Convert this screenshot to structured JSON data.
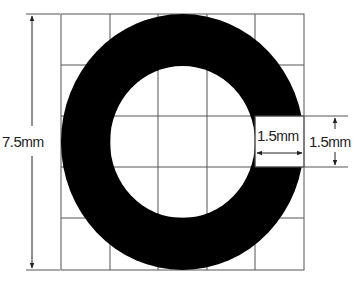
{
  "diagram": {
    "type": "dimensioned-figure",
    "grid": {
      "rows": 5,
      "cols": 5
    },
    "colors": {
      "ring": "#000000",
      "grid": "#555555",
      "background": "#ffffff",
      "text": "#222222"
    },
    "dimensions": {
      "overall_height": {
        "value": "7.5",
        "unit": "mm"
      },
      "gap_width": {
        "value": "1.5",
        "unit": "mm"
      },
      "gap_height": {
        "value": "1.5",
        "unit": "mm"
      }
    }
  }
}
